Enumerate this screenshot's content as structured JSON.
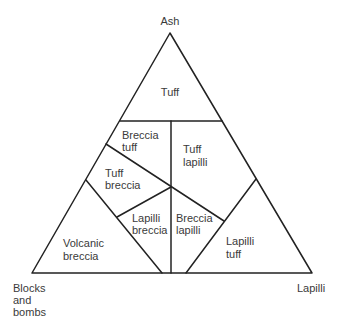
{
  "diagram": {
    "type": "ternary",
    "colors": {
      "line": "#222222",
      "text": "#3a3a3a",
      "background": "#ffffff"
    },
    "vertices": {
      "top": {
        "label": "Ash"
      },
      "bottom_left": {
        "label_lines": [
          "Blocks",
          "and",
          "bombs"
        ]
      },
      "bottom_right": {
        "label": "Lapilli"
      }
    },
    "fields": [
      {
        "id": "tuff",
        "lines": [
          "Tuff"
        ]
      },
      {
        "id": "breccia-tuff",
        "lines": [
          "Breccia",
          "tuff"
        ]
      },
      {
        "id": "tuff-lapilli",
        "lines": [
          "Tuff",
          "lapilli"
        ]
      },
      {
        "id": "tuff-breccia",
        "lines": [
          "Tuff",
          "breccia"
        ]
      },
      {
        "id": "lapilli-breccia",
        "lines": [
          "Lapilli",
          "breccia"
        ]
      },
      {
        "id": "breccia-lapilli",
        "lines": [
          "Breccia",
          "lapilli"
        ]
      },
      {
        "id": "volcanic-breccia",
        "lines": [
          "Volcanic",
          "breccia"
        ]
      },
      {
        "id": "lapilli-tuff",
        "lines": [
          "Lapilli",
          "tuff"
        ]
      }
    ]
  }
}
